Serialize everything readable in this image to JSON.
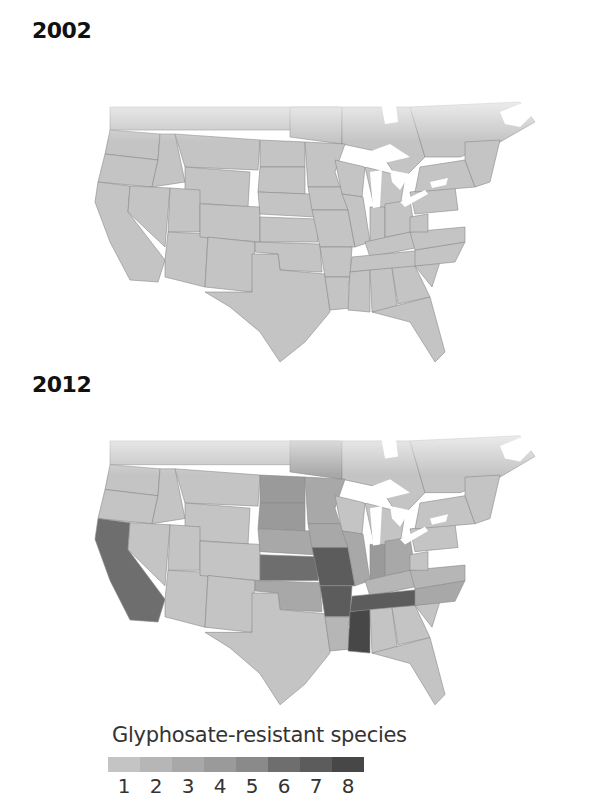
{
  "maps": [
    {
      "year": "2002"
    },
    {
      "year": "2012"
    }
  ],
  "legend": {
    "title": "Glyphosate-resistant species",
    "ticks": [
      "1",
      "2",
      "3",
      "4",
      "5",
      "6",
      "7",
      "8"
    ],
    "colors": [
      "#c4c4c4",
      "#b6b6b6",
      "#a8a8a8",
      "#9a9a9a",
      "#8a8a8a",
      "#6e6e6e",
      "#5c5c5c",
      "#474747"
    ]
  },
  "colors": {
    "water": "#ffffff",
    "border": "#8a8a8a",
    "background": "#ffffff"
  },
  "chart_data": {
    "type": "heatmap",
    "panels": [
      "2002",
      "2012"
    ],
    "legend_title": "Glyphosate-resistant species",
    "scale": [
      1,
      2,
      3,
      4,
      5,
      6,
      7,
      8
    ],
    "values_2002": {
      "all_regions": 1
    },
    "values_2012": {
      "California": 6,
      "Kansas": 6,
      "Missouri": 7,
      "Arkansas": 7,
      "Tennessee": 7,
      "Mississippi": 8,
      "North Dakota": 4,
      "South Dakota": 4,
      "Indiana": 4,
      "Minnesota": 3,
      "Iowa": 3,
      "Nebraska": 3,
      "Illinois": 3,
      "Ohio": 3,
      "Oklahoma": 3,
      "North Carolina": 3,
      "Manitoba": 3,
      "Kentucky": 2,
      "Louisiana": 2,
      "Virginia": 2,
      "Other regions": 1
    }
  }
}
